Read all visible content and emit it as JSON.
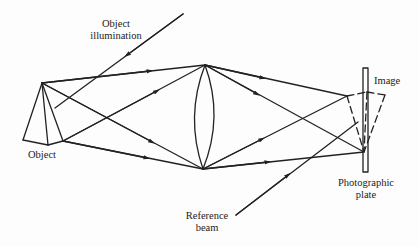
{
  "diagram": {
    "colors": {
      "line": "#222222",
      "background": "#fdfdfd",
      "text": "#222222"
    },
    "labels": {
      "object_illumination_line1": "Object",
      "object_illumination_line2": "illumination",
      "object": "Object",
      "image": "Image",
      "reference_beam_line1": "Reference",
      "reference_beam_line2": "beam",
      "photographic_plate_line1": "Photographic",
      "photographic_plate_line2": "plate"
    },
    "nodes": [
      {
        "id": "object",
        "label": "Object",
        "shape": "pyramid (solid)"
      },
      {
        "id": "lens",
        "label": "",
        "shape": "biconvex lens"
      },
      {
        "id": "image",
        "label": "Image",
        "shape": "inverted pyramid (dashed)"
      },
      {
        "id": "plate",
        "label": "Photographic plate",
        "shape": "thin vertical rectangle"
      },
      {
        "id": "object-illumination",
        "label": "Object illumination",
        "shape": "incoming arrow ray"
      },
      {
        "id": "reference-beam",
        "label": "Reference beam",
        "shape": "incoming arrow ray"
      }
    ],
    "edges": [
      {
        "from": "object-illumination",
        "to": "object"
      },
      {
        "from": "object",
        "to": "lens",
        "count": 4
      },
      {
        "from": "lens",
        "to": "image",
        "count": 4
      },
      {
        "from": "reference-beam",
        "to": "plate"
      }
    ]
  }
}
